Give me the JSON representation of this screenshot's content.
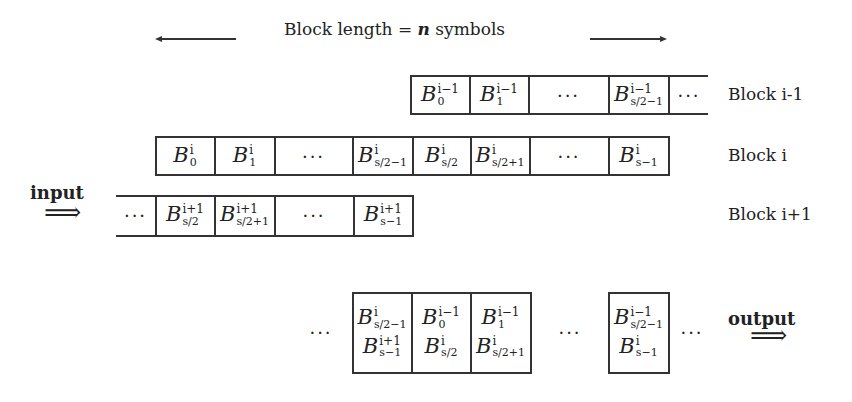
{
  "title": {
    "prefix": "Block length = ",
    "var": "n",
    "suffix": " symbols"
  },
  "labels": {
    "block_prev": "Block i-1",
    "block_cur": "Block i",
    "block_next": "Block i+1",
    "input": "input",
    "output": "output",
    "arrow": "⟹",
    "dots": "···"
  },
  "rows": {
    "block_prev": [
      {
        "sup": "i−1",
        "sub": "0"
      },
      {
        "sup": "i−1",
        "sub": "1"
      },
      {
        "dots": true
      },
      {
        "sup": "i−1",
        "sub": "s/2−1"
      },
      {
        "dots": true
      }
    ],
    "block_cur": [
      {
        "sup": "i",
        "sub": "0"
      },
      {
        "sup": "i",
        "sub": "1"
      },
      {
        "dots": true
      },
      {
        "sup": "i",
        "sub": "s/2−1"
      },
      {
        "sup": "i",
        "sub": "s/2"
      },
      {
        "sup": "i",
        "sub": "s/2+1"
      },
      {
        "dots": true
      },
      {
        "sup": "i",
        "sub": "s−1"
      }
    ],
    "block_next": [
      {
        "dots": true
      },
      {
        "sup": "i+1",
        "sub": "s/2"
      },
      {
        "sup": "i+1",
        "sub": "s/2+1"
      },
      {
        "dots": true
      },
      {
        "sup": "i+1",
        "sub": "s−1"
      }
    ],
    "output": [
      {
        "top": {
          "sup": "i",
          "sub": "s/2−1"
        },
        "bottom": {
          "sup": "i+1",
          "sub": "s−1"
        }
      },
      {
        "top": {
          "sup": "i−1",
          "sub": "0"
        },
        "bottom": {
          "sup": "i",
          "sub": "s/2"
        }
      },
      {
        "top": {
          "sup": "i−1",
          "sub": "1"
        },
        "bottom": {
          "sup": "i",
          "sub": "s/2+1"
        }
      },
      {
        "top": {
          "sup": "i−1",
          "sub": "s/2−1"
        },
        "bottom": {
          "sup": "i",
          "sub": "s−1"
        }
      }
    ]
  },
  "symbol_letter": "B"
}
